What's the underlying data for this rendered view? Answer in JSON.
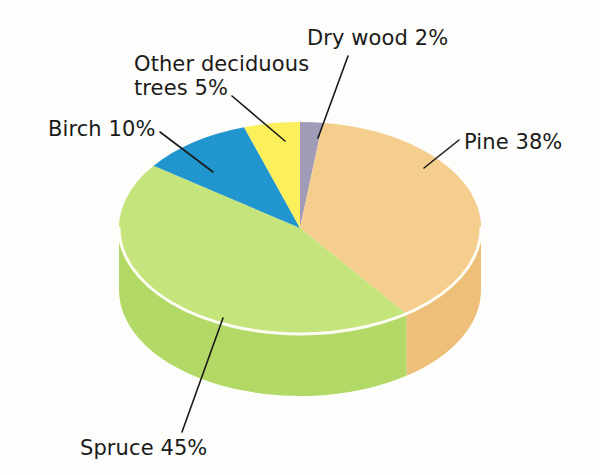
{
  "figure": {
    "background_color": "#fdfdfc",
    "text_color": "#1a1a18"
  },
  "chart_data": {
    "type": "pie",
    "title": "",
    "subtitle": "",
    "xlabel": "",
    "ylabel": "",
    "three_d": true,
    "start_angle_deg": 0,
    "direction": "clockwise",
    "legend": "none",
    "grid": false,
    "labels_as_callouts": true,
    "categories": [
      "Dry wood",
      "Pine",
      "Spruce",
      "Birch",
      "Other deciduous trees"
    ],
    "values": [
      2,
      38,
      45,
      10,
      5
    ],
    "units": "%",
    "total": 100,
    "colors": [
      "#a09cb8",
      "#f5ce8e",
      "#c5e47c",
      "#2196ce",
      "#fbef5c"
    ],
    "side_colors": [
      "#8e8aa6",
      "#edbf79",
      "#b2d965",
      "#1b83b7",
      "#ecdd4c"
    ],
    "slices": [
      {
        "name": "Dry wood",
        "value": 2,
        "label": "Dry wood 2%",
        "color": "#a09cb8",
        "side_color": "#8e8aa6"
      },
      {
        "name": "Pine",
        "value": 38,
        "label": "Pine 38%",
        "color": "#f5ce8e",
        "side_color": "#edbf79"
      },
      {
        "name": "Spruce",
        "value": 45,
        "label": "Spruce 45%",
        "color": "#c5e47c",
        "side_color": "#b2d965"
      },
      {
        "name": "Birch",
        "value": 10,
        "label": "Birch 10%",
        "color": "#2196ce",
        "side_color": "#1b83b7"
      },
      {
        "name": "Other deciduous trees",
        "value": 5,
        "label": "Other deciduous\ntrees 5%",
        "color": "#fbef5c",
        "side_color": "#ecdd4c"
      }
    ]
  },
  "callouts": {
    "dry_wood": "Dry wood 2%",
    "other_deciduous_line1": "Other deciduous",
    "other_deciduous_line2": "trees 5%",
    "birch": "Birch 10%",
    "pine": "Pine 38%",
    "spruce": "Spruce 45%"
  }
}
